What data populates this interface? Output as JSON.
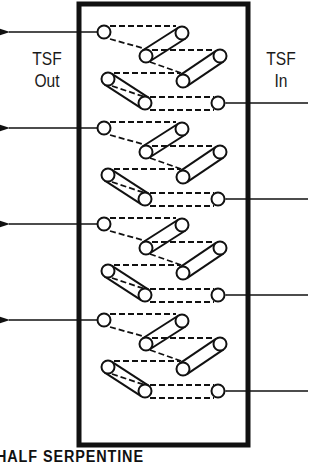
{
  "diagram": {
    "labels": {
      "out": [
        "TSF",
        "Out"
      ],
      "in": [
        "TSF",
        "In"
      ]
    },
    "caption": "HALF SERPENTINE",
    "box": {
      "x": 79,
      "y": 4,
      "width": 169,
      "height": 441
    },
    "repeat_units": 4,
    "unit_pitch": 96,
    "outlet_rows_y": [
      32,
      128,
      224,
      320
    ],
    "inlet_rows_y": [
      103,
      199,
      295,
      391
    ],
    "colors": {
      "line": "#111111",
      "background": "#ffffff"
    }
  }
}
